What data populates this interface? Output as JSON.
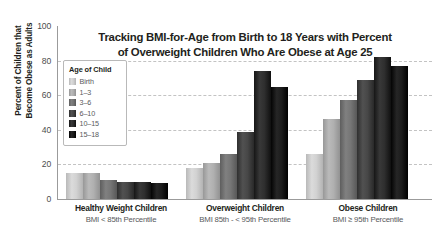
{
  "chart_data": {
    "type": "bar",
    "title": "Tracking BMI-for-Age from Birth to 18 Years with Percent of Overweight Children Who Are Obese at Age 25",
    "title_line1": "Tracking BMI-for-Age from Birth to 18 Years with Percent",
    "title_line2": "of Overweight Children Who Are Obese at Age 25",
    "xlabel": "",
    "ylabel": "Percent of Children that Become Obese as Adults",
    "ylabel_line1": "Percent of Children that",
    "ylabel_line2": "Become Obese as Adults",
    "ylim": [
      0,
      100
    ],
    "yticks": [
      0,
      20,
      40,
      60,
      80,
      100
    ],
    "ytick_labels": [
      "0",
      "20",
      "40",
      "60",
      "80",
      "100"
    ],
    "grid": true,
    "legend_title": "Age of Child",
    "legend_position": "upper-left-inside",
    "categories": [
      "Healthy Weight Children",
      "Overweight Children",
      "Obese Children"
    ],
    "category_sublabels": [
      "BMI < 85th Percentile",
      "BMI 85th - < 95th Percentile",
      "BMI ≥ 95th Percentile"
    ],
    "series": [
      {
        "name": "Birth",
        "color": "#c9c9c9",
        "values": [
          15,
          18,
          26
        ]
      },
      {
        "name": "1–3",
        "color": "#a8a8a8",
        "values": [
          15,
          21,
          46
        ]
      },
      {
        "name": "3–6",
        "color": "#6e6e6e",
        "values": [
          11,
          26,
          57
        ]
      },
      {
        "name": "6–10",
        "color": "#3f3f3f",
        "values": [
          10,
          39,
          69
        ]
      },
      {
        "name": "10–15",
        "color": "#262626",
        "values": [
          10,
          74,
          82
        ]
      },
      {
        "name": "15–18",
        "color": "#141414",
        "values": [
          9,
          65,
          77
        ]
      }
    ]
  }
}
